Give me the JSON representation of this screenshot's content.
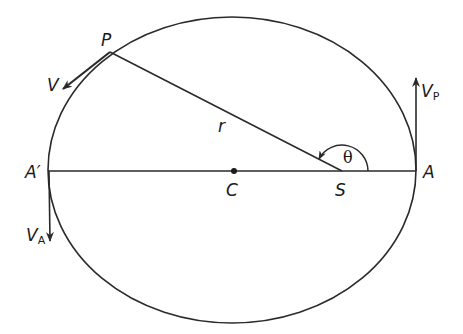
{
  "diagram": {
    "type": "elliptical-orbit",
    "colors": {
      "stroke": "#2a2a2a",
      "background": "#ffffff"
    },
    "ellipse": {
      "cx": 232,
      "cy": 170,
      "rx": 184,
      "ry": 153
    },
    "points": {
      "P": {
        "label": "P",
        "x": 110,
        "y": 52
      },
      "A": {
        "label": "A",
        "x": 416,
        "y": 171
      },
      "A_prime": {
        "label": "A′",
        "x": 48,
        "y": 171
      },
      "C": {
        "label": "C",
        "x": 234,
        "y": 171
      },
      "S": {
        "label": "S",
        "x": 342,
        "y": 171
      }
    },
    "segments": {
      "radius": {
        "label": "r",
        "from": "S",
        "to": "P"
      },
      "major_axis": {
        "from": "A_prime",
        "to": "A"
      }
    },
    "angle": {
      "label": "θ",
      "vertex": "S",
      "from": "A",
      "to": "P",
      "radius": 26
    },
    "velocities": {
      "V": {
        "label": "V",
        "subscript": ""
      },
      "V_P": {
        "label": "V",
        "subscript": "P"
      },
      "V_A": {
        "label": "V",
        "subscript": "A"
      }
    }
  }
}
